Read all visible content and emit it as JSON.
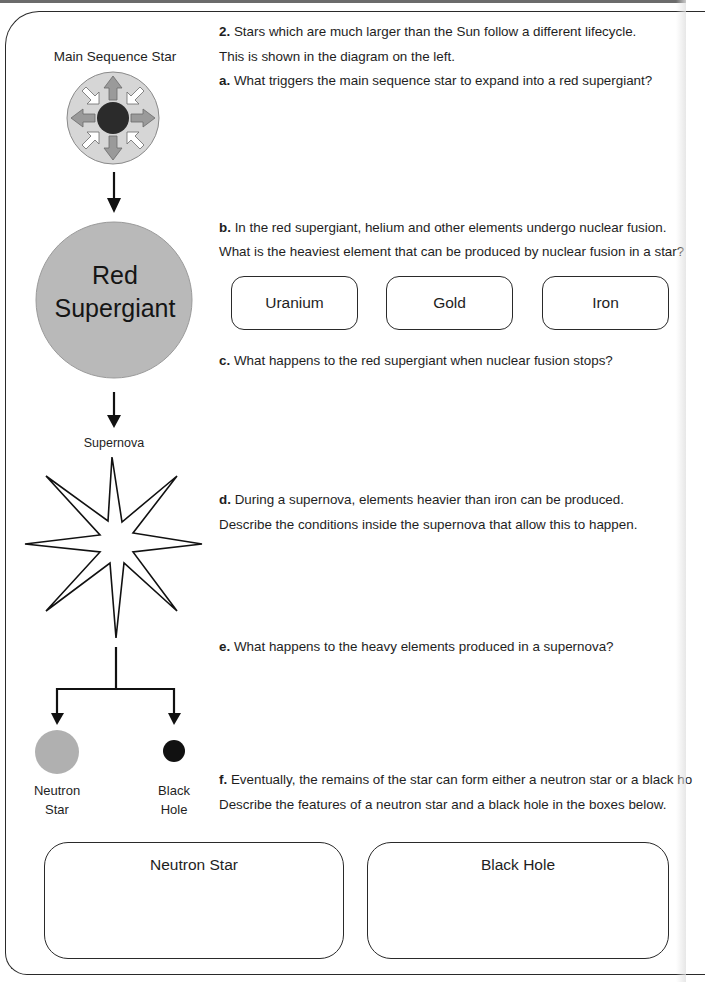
{
  "question": {
    "number": "2.",
    "intro_line1": "Stars which are much larger than the Sun follow a different lifecycle.",
    "intro_line2": "This is shown in the diagram on the left.",
    "parts": {
      "a": {
        "label": "a.",
        "text": "What triggers the main sequence star to expand into a red supergiant?"
      },
      "b": {
        "label": "b.",
        "line1": "In the red supergiant, helium and other elements undergo nuclear fusion.",
        "line2": "What is the heaviest element that can be produced by nuclear fusion in a star?",
        "options": [
          "Uranium",
          "Gold",
          "Iron"
        ]
      },
      "c": {
        "label": "c.",
        "text": "What happens to the red supergiant when nuclear fusion stops?"
      },
      "d": {
        "label": "d.",
        "line1": "During a supernova, elements heavier than iron can be produced.",
        "line2": "Describe the conditions inside the supernova that allow this to happen."
      },
      "e": {
        "label": "e.",
        "text": "What happens to the heavy elements produced in a supernova?"
      },
      "f": {
        "label": "f.",
        "line1": "Eventually, the remains of the star can form either a neutron star or a black ho",
        "line2": "Describe the features of a neutron star and a black hole in the boxes below."
      }
    }
  },
  "diagram": {
    "main_sequence_label": "Main Sequence Star",
    "red_supergiant_line1": "Red",
    "red_supergiant_line2": "Supergiant",
    "supernova_label": "Supernova",
    "neutron_star_line1": "Neutron",
    "neutron_star_line2": "Star",
    "black_hole_line1": "Black",
    "black_hole_line2": "Hole",
    "colors": {
      "main_sequence_fill": "#d6d6d6",
      "core_fill": "#2b2b2b",
      "outward_arrow": "#9a9a9a",
      "inward_arrow": "#ffffff",
      "red_supergiant_fill": "#b9b9b9",
      "neutron_star_fill": "#b0b0b0",
      "black_hole_fill": "#111111"
    }
  },
  "answer_boxes": [
    {
      "title": "Neutron Star"
    },
    {
      "title": "Black Hole"
    }
  ]
}
